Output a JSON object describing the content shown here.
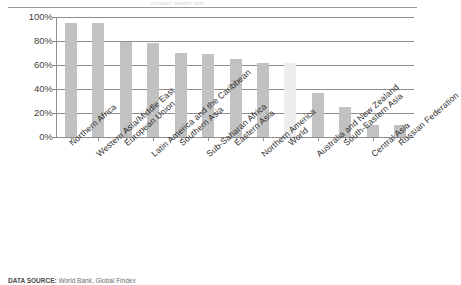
{
  "figure": {
    "top_ghost_text": "cropped header text",
    "source_prefix": "DATA SOURCE:",
    "source_rest": " World Bank, Global Findex"
  },
  "chart_data": {
    "type": "bar",
    "title": "",
    "subtitle": "",
    "xlabel": "",
    "ylabel": "",
    "ylim": [
      0,
      100
    ],
    "grid": true,
    "legend_position": "none",
    "highlight_category": "World",
    "colors": {
      "bar": "#c2c2c2",
      "bar_highlight": "#ededed",
      "axis": "#8d8d8d",
      "text": "#2f2f2f"
    },
    "ytick_labels": [
      "100%",
      "80%",
      "60%",
      "40%",
      "20%",
      "0%"
    ],
    "ytick_values": [
      100,
      80,
      60,
      40,
      20,
      0
    ],
    "categories": [
      "Northern Africa",
      "Western Asia/Middle East",
      "European Union",
      "Latin America and the Caribbean",
      "Southern Asia",
      "Sub-Saharan Africa",
      "Eastern Asia",
      "Northern America",
      "World",
      "Australia and New Zealand",
      "South-Eastern Asia",
      "Central Asia",
      "Russian Federation"
    ],
    "values": [
      95,
      95,
      79,
      78,
      70,
      69,
      65,
      62,
      62,
      37,
      25,
      10,
      10
    ]
  }
}
